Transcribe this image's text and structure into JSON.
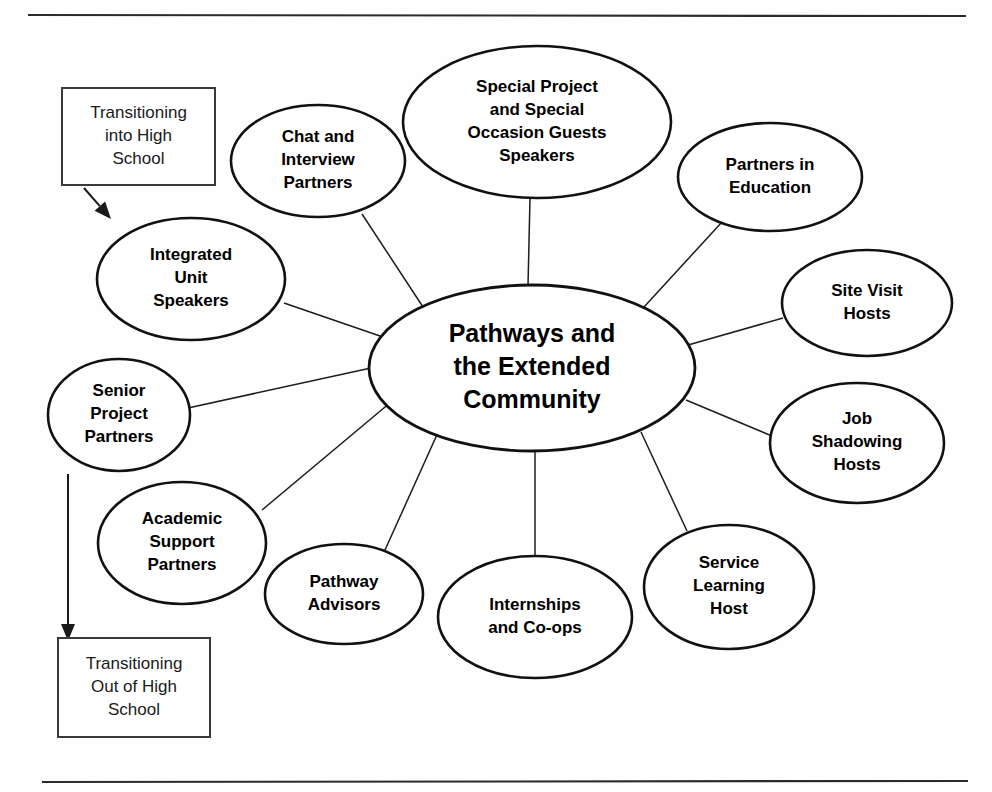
{
  "page": {
    "background_color": "#fefefe",
    "ink_color": "#000000",
    "top_rule": {
      "x1": 28,
      "y1": 15,
      "x2": 966,
      "y2": 16
    },
    "bottom_rule": {
      "x1": 42,
      "y1": 782,
      "x2": 968,
      "y2": 781
    }
  },
  "chart_data": {
    "type": "diagram",
    "subtype": "hub-and-spoke-mind-map",
    "center": {
      "id": "center",
      "label": "Pathways and the Extended Community",
      "lines": [
        "Pathways and",
        "the Extended",
        "Community"
      ],
      "cx": 532,
      "cy": 368,
      "rx": 163,
      "ry": 83,
      "font_size": 25
    },
    "nodes": [
      {
        "id": "chat-and-interview-partners",
        "label": "Chat and Interview Partners",
        "lines": [
          "Chat and",
          "Interview",
          "Partners"
        ],
        "cx": 318,
        "cy": 161,
        "rx": 87,
        "ry": 56
      },
      {
        "id": "special-project-and-special-occasion-guests-speakers",
        "label": "Special Project and Special Occasion Guests Speakers",
        "lines": [
          "Special Project",
          "and Special",
          "Occasion Guests",
          "Speakers"
        ],
        "cx": 537,
        "cy": 122,
        "rx": 134,
        "ry": 76
      },
      {
        "id": "partners-in-education",
        "label": "Partners in Education",
        "lines": [
          "Partners in",
          "Education"
        ],
        "cx": 770,
        "cy": 177,
        "rx": 92,
        "ry": 54
      },
      {
        "id": "site-visit-hosts",
        "label": "Site Visit Hosts",
        "lines": [
          "Site Visit",
          "Hosts"
        ],
        "cx": 867,
        "cy": 303,
        "rx": 85,
        "ry": 53
      },
      {
        "id": "job-shadowing-hosts",
        "label": "Job Shadowing Hosts",
        "lines": [
          "Job",
          "Shadowing",
          "Hosts"
        ],
        "cx": 857,
        "cy": 443,
        "rx": 87,
        "ry": 60
      },
      {
        "id": "service-learning-host",
        "label": "Service Learning Host",
        "lines": [
          "Service",
          "Learning",
          "Host"
        ],
        "cx": 729,
        "cy": 587,
        "rx": 85,
        "ry": 62
      },
      {
        "id": "internships-and-co-ops",
        "label": "Internships and Co-ops",
        "lines": [
          "Internships",
          "and Co-ops"
        ],
        "cx": 535,
        "cy": 617,
        "rx": 97,
        "ry": 61
      },
      {
        "id": "pathway-advisors",
        "label": "Pathway Advisors",
        "lines": [
          "Pathway",
          "Advisors"
        ],
        "cx": 344,
        "cy": 594,
        "rx": 79,
        "ry": 50
      },
      {
        "id": "academic-support-partners",
        "label": "Academic Support Partners",
        "lines": [
          "Academic",
          "Support",
          "Partners"
        ],
        "cx": 182,
        "cy": 543,
        "rx": 84,
        "ry": 61
      },
      {
        "id": "senior-project-partners",
        "label": "Senior Project Partners",
        "lines": [
          "Senior",
          "Project",
          "Partners"
        ],
        "cx": 119,
        "cy": 415,
        "rx": 71,
        "ry": 56
      },
      {
        "id": "integrated-unit-speakers",
        "label": "Integrated Unit Speakers",
        "lines": [
          "Integrated",
          "Unit",
          "Speakers"
        ],
        "cx": 191,
        "cy": 279,
        "rx": 94,
        "ry": 61
      }
    ],
    "edges": [
      {
        "from": "center",
        "to": "chat-and-interview-partners",
        "x1": 425,
        "y1": 310,
        "x2": 362,
        "y2": 214
      },
      {
        "from": "center",
        "to": "special-project-and-special-occasion-guests-speakers",
        "x1": 528,
        "y1": 286,
        "x2": 530,
        "y2": 198
      },
      {
        "from": "center",
        "to": "partners-in-education",
        "x1": 644,
        "y1": 307,
        "x2": 722,
        "y2": 222
      },
      {
        "from": "center",
        "to": "site-visit-hosts",
        "x1": 688,
        "y1": 345,
        "x2": 783,
        "y2": 318
      },
      {
        "from": "center",
        "to": "job-shadowing-hosts",
        "x1": 686,
        "y1": 400,
        "x2": 772,
        "y2": 436
      },
      {
        "from": "center",
        "to": "service-learning-host",
        "x1": 641,
        "y1": 432,
        "x2": 687,
        "y2": 531
      },
      {
        "from": "center",
        "to": "internships-and-co-ops",
        "x1": 535,
        "y1": 451,
        "x2": 535,
        "y2": 556
      },
      {
        "from": "center",
        "to": "pathway-advisors",
        "x1": 440,
        "y1": 428,
        "x2": 385,
        "y2": 550
      },
      {
        "from": "center",
        "to": "academic-support-partners",
        "x1": 391,
        "y1": 402,
        "x2": 262,
        "y2": 510
      },
      {
        "from": "center",
        "to": "senior-project-partners",
        "x1": 371,
        "y1": 368,
        "x2": 188,
        "y2": 408
      },
      {
        "from": "center",
        "to": "integrated-unit-speakers",
        "x1": 380,
        "y1": 336,
        "x2": 284,
        "y2": 303
      }
    ],
    "boxes": [
      {
        "id": "transitioning-into-high-school",
        "label": "Transitioning into High School",
        "lines": [
          "Transitioning",
          "into High",
          "School"
        ],
        "x": 62,
        "y": 88,
        "width": 153,
        "height": 97
      },
      {
        "id": "transitioning-out-of-high-school",
        "label": "Transitioning Out of High School",
        "lines": [
          "Transitioning",
          "Out of High",
          "School"
        ],
        "x": 58,
        "y": 638,
        "width": 152,
        "height": 99
      }
    ],
    "arrows": [
      {
        "id": "arrow-into-high-school",
        "from": "transitioning-into-high-school",
        "to": "integrated-unit-speakers",
        "x1": 84,
        "y1": 188,
        "x2": 111,
        "y2": 219,
        "direction": "down-right"
      },
      {
        "id": "arrow-out-of-high-school",
        "from": "senior-project-partners",
        "to": "transitioning-out-of-high-school",
        "x1": 68,
        "y1": 474,
        "x2": 68,
        "y2": 641,
        "direction": "down"
      }
    ],
    "legend_position": "none",
    "grid": false
  }
}
